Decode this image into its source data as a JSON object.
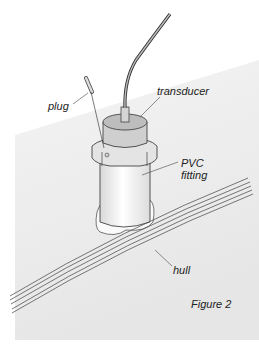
{
  "figure": {
    "caption": "Figure 2",
    "labels": {
      "plug": "plug",
      "transducer": "transducer",
      "pvc_line1": "PVC",
      "pvc_line2": "fitting",
      "hull": "hull"
    }
  }
}
